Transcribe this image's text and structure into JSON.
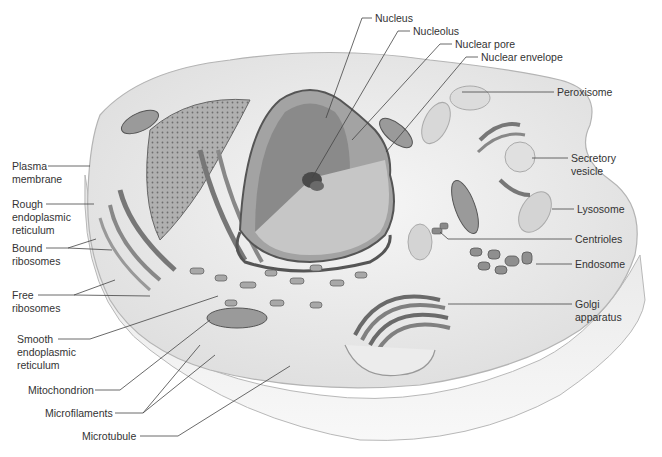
{
  "diagram": {
    "colors": {
      "label_text": "#333333",
      "leader_line": "#444444",
      "cytoplasm": "#ececec",
      "membrane_edge": "#b8b8b8",
      "nucleus_dark": "#8a8a8a",
      "nucleus_light": "#c6c6c6",
      "nucleolus": "#4a4a4a",
      "organelle": "#9a9a9a"
    },
    "labels": {
      "nucleus": "Nucleus",
      "nucleolus": "Nucleolus",
      "nuclear_pore": "Nuclear pore",
      "nuclear_envelope": "Nuclear envelope",
      "peroxisome": "Peroxisome",
      "secretory_vesicle": "Secretory\nvesicle",
      "lysosome": "Lysosome",
      "centrioles": "Centrioles",
      "endosome": "Endosome",
      "golgi_apparatus": "Golgi\napparatus",
      "plasma_membrane": "Plasma\nmembrane",
      "rough_er": "Rough\nendoplasmic\nreticulum",
      "bound_ribosomes": "Bound\nribosomes",
      "free_ribosomes": "Free\nribosomes",
      "smooth_er": "Smooth\nendoplasmic\nreticulum",
      "mitochondrion": "Mitochondrion",
      "microfilaments": "Microfilaments",
      "microtubule": "Microtubule"
    }
  }
}
